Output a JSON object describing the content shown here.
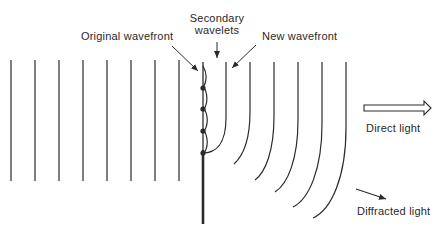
{
  "diagram": {
    "colors": {
      "line": "#2b2b2b",
      "background": "#ffffff"
    },
    "labels": {
      "original_wavefront": "Original wavefront",
      "secondary_wavelets_line1": "Secondary",
      "secondary_wavelets_line2": "wavelets",
      "new_wavefront": "New wavefront",
      "direct_light": "Direct light",
      "diffracted_light": "Diffracted light"
    },
    "incident_wavefronts_x": [
      11,
      35,
      59,
      83,
      107,
      131,
      155,
      179
    ],
    "incident_wavefront_y": [
      60,
      181
    ],
    "barrier": {
      "x": 203,
      "aperture_top": 62,
      "edge_y": 150,
      "bottom": 224
    },
    "wavelet_sources_y": [
      88,
      109,
      131,
      153
    ],
    "new_wavefront_x": 226,
    "diffracted_wavefronts": [
      {
        "x": 250,
        "end": [
          234,
          164
        ]
      },
      {
        "x": 274,
        "end": [
          255,
          180
        ]
      },
      {
        "x": 298,
        "end": [
          275,
          192
        ]
      },
      {
        "x": 322,
        "end": [
          293,
          207
        ]
      },
      {
        "x": 346,
        "end": [
          313,
          218
        ]
      }
    ]
  }
}
